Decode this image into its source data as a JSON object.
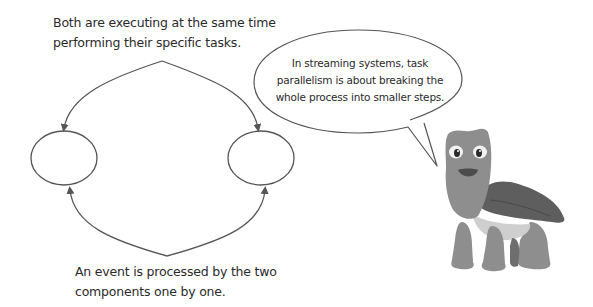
{
  "diagram": {
    "top_caption": {
      "lines": [
        "Both are executing at the same time",
        "performing their specific tasks."
      ]
    },
    "bottom_caption": {
      "lines": [
        "An event is processed by the two",
        "components one by one."
      ]
    },
    "components": [
      {
        "id": "left-component",
        "label": ""
      },
      {
        "id": "right-component",
        "label": ""
      }
    ],
    "speech_bubble": {
      "lines": [
        "In streaming systems, task",
        "parallelism is about breaking the",
        "whole process into smaller steps."
      ]
    },
    "character": {
      "name": "turtle-mascot"
    },
    "colors": {
      "line": "#555555",
      "text": "#2a2a2a",
      "background": "#ffffff",
      "turtle_body": "#8e8e8e",
      "turtle_shell": "#5e5e5e",
      "turtle_belly": "#cfcfcf"
    }
  }
}
